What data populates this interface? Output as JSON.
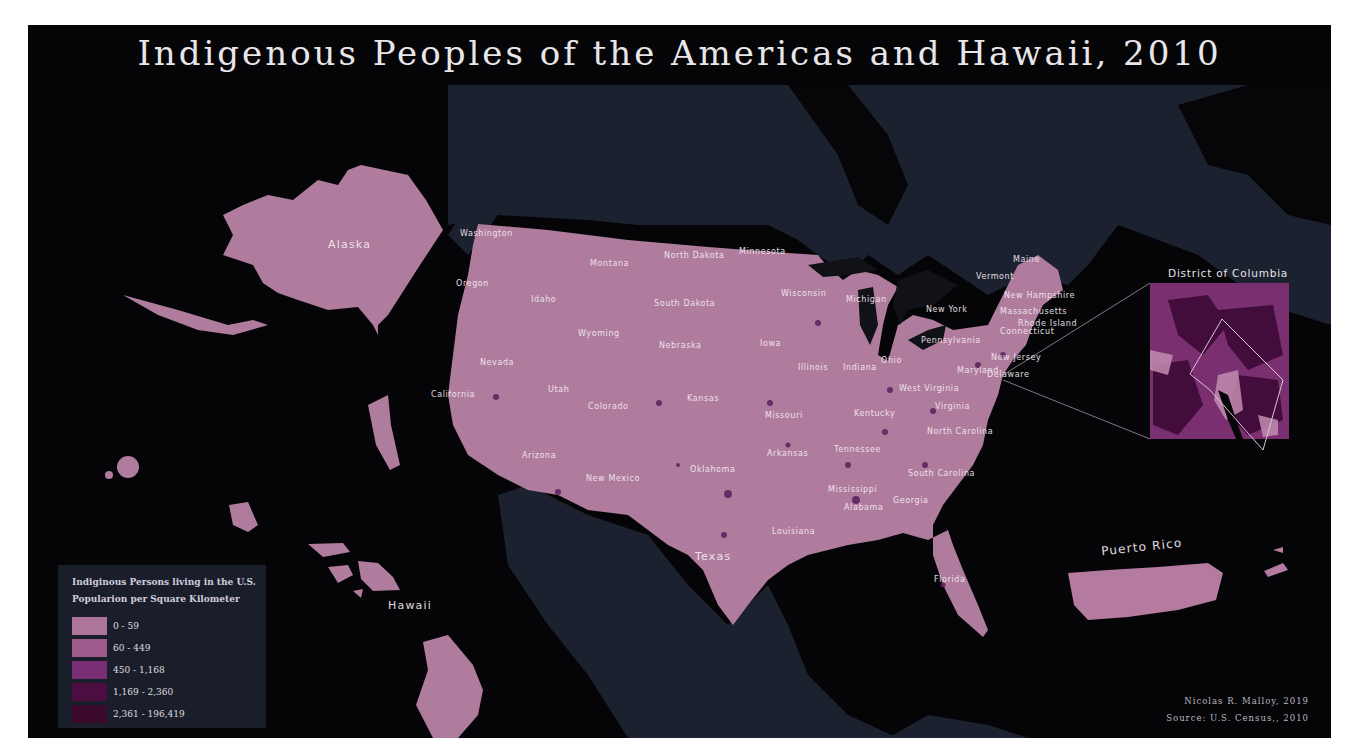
{
  "title": "Indigenous Peoples of the Americas and Hawaii, 2010",
  "colors": {
    "water": "#050507",
    "foreign_land": "#1c2130",
    "us_land": "#b07c9e",
    "dense_spots": "#5a1f5c",
    "label_text": "#f3eaf1",
    "legend_bg": "#1b1f2c"
  },
  "regions": {
    "alaska": "Alaska",
    "hawaii": "Hawaii",
    "puerto_rico": "Puerto Rico",
    "texas": "Texas"
  },
  "states": [
    {
      "name": "Washington",
      "x": 460,
      "y": 229
    },
    {
      "name": "Oregon",
      "x": 456,
      "y": 279
    },
    {
      "name": "Idaho",
      "x": 531,
      "y": 295
    },
    {
      "name": "Montana",
      "x": 590,
      "y": 259
    },
    {
      "name": "North Dakota",
      "x": 664,
      "y": 251
    },
    {
      "name": "Minnesota",
      "x": 739,
      "y": 247
    },
    {
      "name": "South Dakota",
      "x": 654,
      "y": 299
    },
    {
      "name": "Wyoming",
      "x": 578,
      "y": 329
    },
    {
      "name": "Nebraska",
      "x": 659,
      "y": 341
    },
    {
      "name": "Nevada",
      "x": 480,
      "y": 358
    },
    {
      "name": "Utah",
      "x": 548,
      "y": 385
    },
    {
      "name": "California",
      "x": 431,
      "y": 390
    },
    {
      "name": "Colorado",
      "x": 588,
      "y": 402
    },
    {
      "name": "Kansas",
      "x": 687,
      "y": 394
    },
    {
      "name": "Iowa",
      "x": 760,
      "y": 339
    },
    {
      "name": "Wisconsin",
      "x": 781,
      "y": 289
    },
    {
      "name": "Michigan",
      "x": 846,
      "y": 295
    },
    {
      "name": "Illinois",
      "x": 798,
      "y": 363
    },
    {
      "name": "Indiana",
      "x": 843,
      "y": 363
    },
    {
      "name": "Ohio",
      "x": 881,
      "y": 356
    },
    {
      "name": "New York",
      "x": 926,
      "y": 305
    },
    {
      "name": "Pennsylvania",
      "x": 921,
      "y": 336
    },
    {
      "name": "Missouri",
      "x": 765,
      "y": 411
    },
    {
      "name": "Kentucky",
      "x": 854,
      "y": 409
    },
    {
      "name": "West Virginia",
      "x": 899,
      "y": 384
    },
    {
      "name": "Virginia",
      "x": 935,
      "y": 402
    },
    {
      "name": "Maryland",
      "x": 957,
      "y": 366
    },
    {
      "name": "Delaware",
      "x": 987,
      "y": 370
    },
    {
      "name": "New Jersey",
      "x": 991,
      "y": 353
    },
    {
      "name": "Connecticut",
      "x": 1000,
      "y": 327
    },
    {
      "name": "Rhode Island",
      "x": 1018,
      "y": 319
    },
    {
      "name": "Massachusetts",
      "x": 1000,
      "y": 307
    },
    {
      "name": "New Hampshire",
      "x": 1004,
      "y": 291
    },
    {
      "name": "Vermont",
      "x": 976,
      "y": 272
    },
    {
      "name": "Maine",
      "x": 1013,
      "y": 255
    },
    {
      "name": "Arizona",
      "x": 522,
      "y": 451
    },
    {
      "name": "New Mexico",
      "x": 586,
      "y": 474
    },
    {
      "name": "Oklahoma",
      "x": 690,
      "y": 465
    },
    {
      "name": "Arkansas",
      "x": 767,
      "y": 449
    },
    {
      "name": "Tennessee",
      "x": 834,
      "y": 445
    },
    {
      "name": "North Carolina",
      "x": 927,
      "y": 427
    },
    {
      "name": "South Carolina",
      "x": 908,
      "y": 469
    },
    {
      "name": "Mississippi",
      "x": 828,
      "y": 485
    },
    {
      "name": "Alabama",
      "x": 844,
      "y": 503
    },
    {
      "name": "Georgia",
      "x": 893,
      "y": 496
    },
    {
      "name": "Louisiana",
      "x": 772,
      "y": 527
    },
    {
      "name": "Florida",
      "x": 934,
      "y": 575
    }
  ],
  "inset": {
    "title": "District of Columbia"
  },
  "legend": {
    "title_line1": "Indiginous Persons living in the U.S.",
    "title_line2": "Popularion per Square Kilometer",
    "items": [
      {
        "label": "0 - 59",
        "color": "#b57aa0"
      },
      {
        "label": "60 - 449",
        "color": "#a55f92"
      },
      {
        "label": "450 - 1,168",
        "color": "#7e2f79"
      },
      {
        "label": "1,169 - 2,360",
        "color": "#4f0f44"
      },
      {
        "label": "2,361 - 196,419",
        "color": "#3d0a2e"
      }
    ]
  },
  "credits": {
    "author": "Nicolas R. Malloy, 2019",
    "source": "Source: U.S. Census,, 2010"
  }
}
